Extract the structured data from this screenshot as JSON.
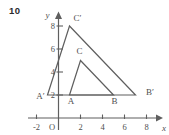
{
  "problem_number": "10",
  "colors": {
    "background": "#ffffff",
    "line": "#5f5f5f",
    "text": "#4f4f4f",
    "number": "#2b2b2b"
  },
  "figure": {
    "axis": {
      "x_label": "x",
      "y_label": "y",
      "origin_label": "O",
      "x_ticks": [
        {
          "value": -2,
          "label": "-2"
        },
        {
          "value": 2,
          "label": "2"
        },
        {
          "value": 4,
          "label": "4"
        },
        {
          "value": 6,
          "label": "6"
        },
        {
          "value": 8,
          "label": "8"
        }
      ],
      "y_ticks": [
        {
          "value": 2,
          "label": "2"
        },
        {
          "value": 4,
          "label": "4"
        },
        {
          "value": 6,
          "label": "6"
        },
        {
          "value": 8,
          "label": "8"
        }
      ]
    }
  },
  "chart_data": {
    "type": "line",
    "xlabel": "x",
    "ylabel": "y",
    "xlim": [
      -2.8,
      9.2
    ],
    "ylim": [
      -1.6,
      9.3
    ],
    "grid": false,
    "legend": "none",
    "series": [
      {
        "name": "triangle ABC",
        "closed": true,
        "points": [
          {
            "x": 1,
            "y": 2,
            "label": "A",
            "label_dx": 1.5,
            "label_dy": 9
          },
          {
            "x": 5,
            "y": 2,
            "label": "B",
            "label_dx": 1,
            "label_dy": 9
          },
          {
            "x": 2,
            "y": 5,
            "label": "C",
            "label_dx": -1,
            "label_dy": -6.5
          }
        ]
      },
      {
        "name": "triangle A′B′C′",
        "closed": true,
        "points": [
          {
            "x": -1,
            "y": 2,
            "label": "A′",
            "label_dx": -7,
            "label_dy": 3.5
          },
          {
            "x": 7,
            "y": 2,
            "label": "B′",
            "label_dx": 14.5,
            "label_dy": 0
          },
          {
            "x": 1,
            "y": 8,
            "label": "C′",
            "label_dx": 8,
            "label_dy": -5
          }
        ]
      }
    ]
  }
}
